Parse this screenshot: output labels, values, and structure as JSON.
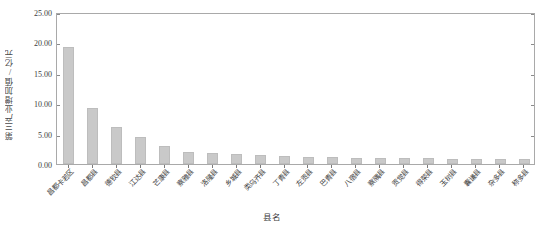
{
  "chart_data": {
    "type": "bar",
    "title": "",
    "xlabel": "县名",
    "ylabel": "第三产业增加值/亿元",
    "ylim": [
      0,
      25
    ],
    "ytick_labels": [
      "0.00",
      "5.00",
      "10.00",
      "15.00",
      "20.00",
      "25.00"
    ],
    "ytick_values": [
      0,
      5,
      10,
      15,
      20,
      25
    ],
    "grid": false,
    "legend": null,
    "bar_color": "#c9c9c9",
    "bar_edge_color": "#bdbdbd",
    "axis_color": "#a9a9a9",
    "categories": [
      "昌都卡若区",
      "昌都县",
      "德钦县",
      "江达县",
      "芒康县",
      "察雅县",
      "洛隆县",
      "乡城县",
      "类乌齐县",
      "丁青县",
      "左贡县",
      "巴青县",
      "八宿县",
      "察隅县",
      "贡觉县",
      "得荣县",
      "玉树县",
      "囊谦县",
      "杂多县",
      "称多县"
    ],
    "values": [
      19.2,
      9.2,
      6.1,
      4.5,
      3.0,
      2.0,
      1.75,
      1.6,
      1.5,
      1.3,
      1.2,
      1.1,
      1.05,
      1.0,
      1.0,
      0.95,
      0.9,
      0.9,
      0.85,
      0.8
    ]
  }
}
